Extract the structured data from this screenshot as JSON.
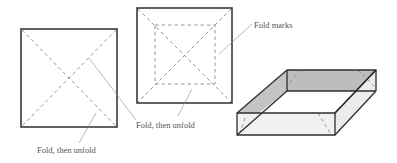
{
  "diagram": {
    "steps": [
      {
        "id": "step-1",
        "description": "Square sheet with both diagonals folded",
        "label": "Fold, then unfold"
      },
      {
        "id": "step-2",
        "description": "Square sheet with diagonals and inner square fold marks",
        "labels": [
          "Fold marks",
          "Fold, then unfold"
        ]
      },
      {
        "id": "step-3",
        "description": "Completed open box with fold creases visible"
      }
    ],
    "labels": {
      "step1_fold": "Fold, then unfold",
      "step2_fold": "Fold, then unfold",
      "step2_marks": "Fold marks"
    },
    "colors": {
      "frame": "#3a3a3a",
      "fold_line": "#8a8a8a",
      "box_back_wall": "#bdbdbd",
      "box_side_light": "#ececec",
      "box_floor": "#ffffff",
      "text": "#555555"
    }
  }
}
